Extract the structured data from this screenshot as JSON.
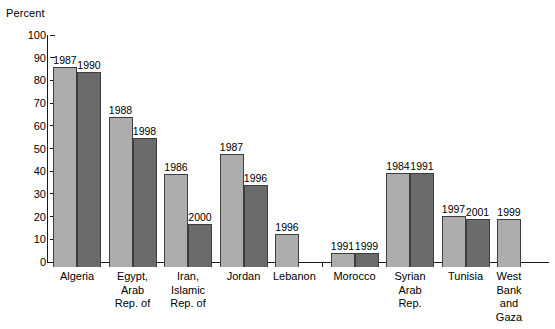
{
  "chart_data": {
    "type": "bar",
    "title": "",
    "subtitle": "",
    "xlabel": "",
    "ylabel": "Percent",
    "ylim": [
      0,
      100
    ],
    "ytick_labels": [
      "100",
      "90",
      "80",
      "70",
      "60",
      "50",
      "40",
      "30",
      "20",
      "10",
      "0"
    ],
    "ytick_values": [
      100,
      90,
      80,
      70,
      60,
      50,
      40,
      30,
      20,
      10,
      0
    ],
    "grid": false,
    "legend": "none",
    "legend_entries": [],
    "annotations": "Each bar is annotated with its survey year above the bar.",
    "categories": [
      "Algeria",
      "Egypt,\nArab\nRep. of",
      "Iran,\nIslamic\nRep. of",
      "Jordan",
      "Lebanon",
      "Morocco",
      "Syrian\nArab\nRep.",
      "Tunisia",
      "West Bank\nand Gaza"
    ],
    "series": [
      {
        "name": "earlier-year",
        "shade": "light",
        "color": "#adadad",
        "values": [
          88,
          66,
          41,
          50,
          14.5,
          6,
          41.5,
          22.5,
          21
        ],
        "year_labels": [
          "1987",
          "1988",
          "1986",
          "1987",
          "1996",
          "1991",
          "1984",
          "1997",
          "1999"
        ]
      },
      {
        "name": "later-year",
        "shade": "dark",
        "color": "#6b6b6b",
        "values": [
          86,
          57,
          19,
          36,
          null,
          6,
          41.5,
          21,
          null
        ],
        "year_labels": [
          "1990",
          "1998",
          "2000",
          "1996",
          "",
          "1999",
          "1991",
          "2001",
          ""
        ]
      }
    ]
  },
  "bars": [
    {
      "category": "Algeria",
      "category_display": "Algeria",
      "light_value": 88,
      "light_year": "1987",
      "dark_value": 86,
      "dark_year": "1990"
    },
    {
      "category": "Egypt, Arab Rep. of",
      "category_display": "Egypt,\nArab\nRep. of",
      "light_value": 66,
      "light_year": "1988",
      "dark_value": 57,
      "dark_year": "1998"
    },
    {
      "category": "Iran, Islamic Rep. of",
      "category_display": "Iran,\nIslamic\nRep. of",
      "light_value": 41,
      "light_year": "1986",
      "dark_value": 19,
      "dark_year": "2000"
    },
    {
      "category": "Jordan",
      "category_display": "Jordan",
      "light_value": 50,
      "light_year": "1987",
      "dark_value": 36,
      "dark_year": "1996"
    },
    {
      "category": "Lebanon",
      "category_display": "Lebanon",
      "light_value": 14.5,
      "light_year": "1996",
      "dark_value": null,
      "dark_year": ""
    },
    {
      "category": "Morocco",
      "category_display": "Morocco",
      "light_value": 6,
      "light_year": "1991",
      "dark_value": 6,
      "dark_year": "1999"
    },
    {
      "category": "Syrian Arab Rep.",
      "category_display": "Syrian\nArab\nRep.",
      "light_value": 41.5,
      "light_year": "1984",
      "dark_value": 41.5,
      "dark_year": "1991"
    },
    {
      "category": "Tunisia",
      "category_display": "Tunisia",
      "light_value": 22.5,
      "light_year": "1997",
      "dark_value": 21,
      "dark_year": "2001"
    },
    {
      "category": "West Bank and Gaza",
      "category_display": "West Bank\nand Gaza",
      "light_value": 21,
      "light_year": "1999",
      "dark_value": null,
      "dark_year": ""
    }
  ],
  "colors": {
    "light_bar": "#adadad",
    "dark_bar": "#6b6b6b",
    "bar_outline": "#3d3d3d",
    "axis": "#1a1a1a",
    "background": "#ffffff",
    "text": "#000000"
  }
}
